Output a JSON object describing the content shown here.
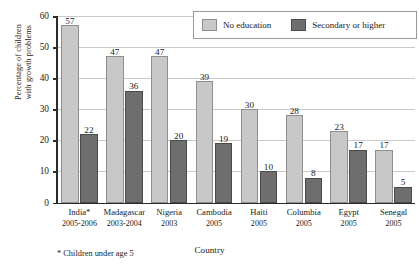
{
  "chart_data": {
    "type": "bar",
    "title": "",
    "xlabel": "Country",
    "ylabel": "Percentage of children with growth problems",
    "ylabel_line1": "Percentage of children",
    "ylabel_line2": "with growth problems",
    "ylim": [
      0,
      60
    ],
    "yticks": [
      0,
      10,
      20,
      30,
      40,
      50,
      60
    ],
    "grid": true,
    "legend_position": "top-right",
    "categories": [
      "India*",
      "Madagascar",
      "Nigeria",
      "Cambodia",
      "Haiti",
      "Columbia",
      "Egypt",
      "Senegal"
    ],
    "category_years": [
      "2005-2006",
      "2003-2004",
      "2003",
      "2005",
      "2005",
      "2005",
      "2005",
      "2005"
    ],
    "series": [
      {
        "name": "No education",
        "color": "#c8c8c8",
        "values": [
          57,
          47,
          47,
          39,
          30,
          28,
          23,
          17
        ]
      },
      {
        "name": "Secondary or higher",
        "color": "#6e6e6e",
        "values": [
          22,
          36,
          20,
          19,
          10,
          8,
          17,
          5
        ]
      }
    ],
    "footnote": "* Children under age 5"
  }
}
